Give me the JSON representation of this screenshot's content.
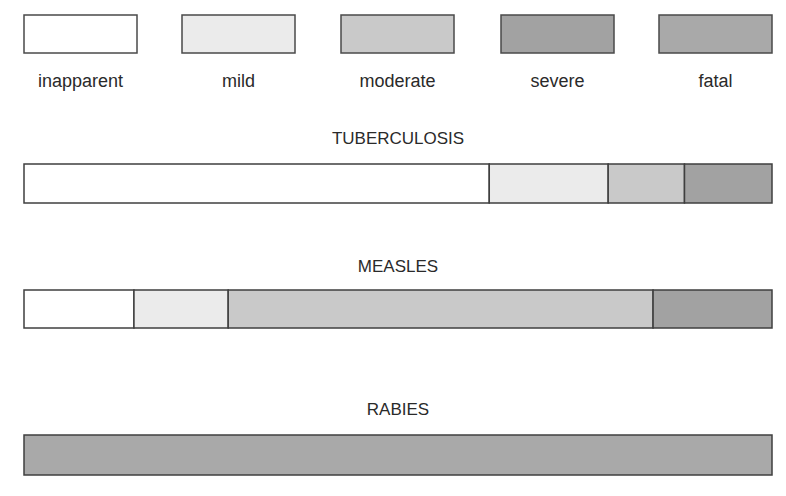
{
  "chart_data": {
    "type": "bar",
    "orientation": "horizontal-stacked",
    "title": "",
    "xlabel": "",
    "ylabel": "",
    "units": "percent of infections",
    "legend": {
      "placement": "top",
      "entries": [
        {
          "key": "inapparent",
          "label": "inapparent",
          "color": "#ffffff"
        },
        {
          "key": "mild",
          "label": "mild",
          "color": "#ebebeb"
        },
        {
          "key": "moderate",
          "label": "moderate",
          "color": "#c9c9c9"
        },
        {
          "key": "severe",
          "label": "severe",
          "color": "#a2a2a2"
        },
        {
          "key": "fatal",
          "label": "fatal",
          "color": "#a9a9a9"
        }
      ]
    },
    "categories": [
      "TUBERCULOSIS",
      "MEASLES",
      "RABIES"
    ],
    "series": [
      {
        "name": "inapparent",
        "values": [
          62.2,
          14.7,
          0
        ]
      },
      {
        "name": "mild",
        "values": [
          15.9,
          12.6,
          0
        ]
      },
      {
        "name": "moderate",
        "values": [
          10.2,
          56.8,
          0
        ]
      },
      {
        "name": "severe",
        "values": [
          11.7,
          15.9,
          0
        ]
      },
      {
        "name": "fatal",
        "values": [
          0,
          0,
          100
        ]
      }
    ],
    "xlim": [
      0,
      100
    ],
    "grid": false
  }
}
